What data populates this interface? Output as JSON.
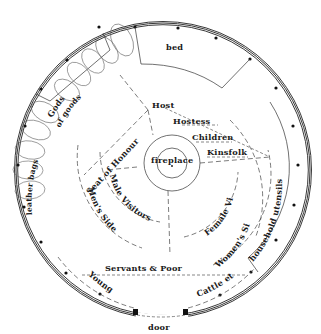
{
  "diagram": {
    "type": "floor-plan",
    "colors": {
      "line": "#222222",
      "background": "#ffffff",
      "post": "#111111"
    },
    "labels": {
      "bed": "bed",
      "gods": "Gods",
      "leather_bags": "leather bags of goods",
      "leather_word": "leather",
      "bags_word": "bags",
      "of_word": "of",
      "goods_word": "goods",
      "host": "Host",
      "hostess": "Hostess",
      "children": "Children",
      "kinsfolk": "Kinsfolk",
      "seat_of_honour": "Seat of Honour",
      "fireplace": "fireplace",
      "male_visitors": "Male Visitors",
      "mens_side": "Men's Side",
      "female_visitors": "Female Visitors",
      "womens_side": "Women's Side",
      "household_utensils": "household utensils",
      "servants_poor": "Servants & Poor",
      "young": "Young",
      "cattle": "Cattle etc.",
      "door": "door"
    },
    "zones": [
      {
        "name": "bed",
        "position": "top (north wall)"
      },
      {
        "name": "Gods",
        "position": "upper-left wall shelf"
      },
      {
        "name": "leather bags of goods",
        "position": "left wall"
      },
      {
        "name": "household utensils",
        "position": "right wall"
      },
      {
        "name": "fireplace",
        "position": "centre"
      },
      {
        "name": "Seat of Honour",
        "position": "upper-left of fireplace"
      },
      {
        "name": "Host",
        "position": "behind fireplace, top"
      },
      {
        "name": "Hostess",
        "position": "right of Host"
      },
      {
        "name": "Children",
        "position": "right of Hostess"
      },
      {
        "name": "Kinsfolk",
        "position": "right of Children"
      },
      {
        "name": "Male Visitors",
        "position": "left-lower of fireplace"
      },
      {
        "name": "Men's Side",
        "position": "left half"
      },
      {
        "name": "Female Visitors",
        "position": "right-lower of fireplace"
      },
      {
        "name": "Women's Side",
        "position": "right half"
      },
      {
        "name": "Servants & Poor",
        "position": "near door"
      },
      {
        "name": "Young",
        "position": "lower-left by door"
      },
      {
        "name": "Cattle etc.",
        "position": "lower-right by door"
      },
      {
        "name": "door",
        "position": "bottom (south)"
      }
    ]
  }
}
